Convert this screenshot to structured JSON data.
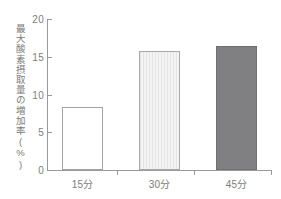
{
  "chart_data": {
    "type": "bar",
    "title": "",
    "subtitle": "",
    "xlabel": "",
    "ylabel": "最大酸素摂取量の増加率(%)",
    "categories": [
      "15分",
      "30分",
      "45分"
    ],
    "values": [
      8.4,
      15.7,
      16.4
    ],
    "series": [
      {
        "name": "最大酸素摂取量の増加率",
        "values": [
          8.4,
          15.7,
          16.4
        ]
      }
    ],
    "ylim": [
      0,
      20
    ],
    "ytick_labels": [
      "20",
      "15",
      "10",
      "5",
      "0"
    ],
    "ytick_values": [
      20,
      15,
      10,
      5,
      0
    ],
    "grid": false,
    "legend": false,
    "legend_position": "none",
    "bar_styles": [
      "open-outline",
      "light-striped",
      "solid-gray"
    ],
    "colors": {
      "bar1_fill": "#ffffff",
      "bar1_stroke": "#a3a3a3",
      "bar2_fill": "#ececed",
      "bar2_stroke": "#a8a8a8",
      "bar3_fill": "#808083",
      "bar3_stroke": "#6f6f6f",
      "axis": "#9a9a9a",
      "text": "#7d7d7d",
      "background": "#ffffff"
    }
  }
}
